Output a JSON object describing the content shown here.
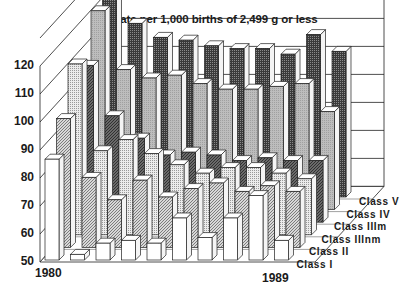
{
  "chart_data": {
    "type": "bar",
    "subtype": "3d-grouped-bar",
    "title": "Rate per 1,000 births of 2,499 g or less",
    "xlabel": "",
    "ylabel": "",
    "ylim": [
      50,
      120
    ],
    "yticks": [
      50,
      60,
      70,
      80,
      90,
      100,
      110,
      120
    ],
    "categories": [
      "1980",
      "1981",
      "1982",
      "1983",
      "1984",
      "1985",
      "1986",
      "1987",
      "1988",
      "1989"
    ],
    "x_tick_labels_shown": [
      "1980",
      "1989"
    ],
    "grid": true,
    "legend_position": "depth-axis labels at right",
    "series": [
      {
        "name": "Class I",
        "pattern": "white",
        "values": [
          86,
          52,
          56,
          57,
          56,
          65,
          58,
          65,
          73,
          57
        ]
      },
      {
        "name": "Class II",
        "pattern": "light-hatch",
        "values": [
          96,
          75,
          67,
          74,
          68,
          71,
          73,
          70,
          72,
          70
        ]
      },
      {
        "name": "Class IIInm",
        "pattern": "light-dotted",
        "values": [
          111,
          80,
          84,
          79,
          75,
          72,
          74,
          74,
          72,
          70
        ]
      },
      {
        "name": "Class IIIm",
        "pattern": "dark-hatch",
        "values": [
          106,
          88,
          80,
          74,
          75,
          74,
          72,
          73,
          72,
          72
        ]
      },
      {
        "name": "Class IV",
        "pattern": "medium-gray",
        "values": [
          121,
          100,
          97,
          98,
          95,
          93,
          93,
          94,
          95,
          85
        ]
      },
      {
        "name": "Class V",
        "pattern": "dark-dotted",
        "values": [
          129,
          112,
          107,
          106,
          104,
          103,
          103,
          101,
          108,
          102
        ]
      }
    ]
  },
  "labels": {
    "title": "Rate per 1,000 births of 2,499 g or less",
    "yticks": [
      "120",
      "110",
      "100",
      "90",
      "80",
      "70",
      "60",
      "50"
    ],
    "x_start": "1980",
    "x_end": "1989",
    "classes": [
      "Class V",
      "Class IV",
      "Class IIIm",
      "Class IIInm",
      "Class II",
      "Class I"
    ]
  }
}
